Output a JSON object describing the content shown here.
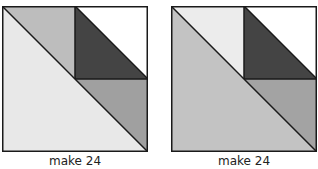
{
  "blocks": [
    {
      "label": "make 24",
      "colors": {
        "large_triangle": "#e8e8e8",
        "top_left_small": "#bdbdbd",
        "top_right_dark": "#444444",
        "top_right_white": "#ffffff",
        "bottom_right_mid": "#a0a0a0",
        "outline": "#1a1a1a"
      }
    },
    {
      "label": "make 24",
      "colors": {
        "large_triangle": "#c3c3c3",
        "top_left_small": "#ececec",
        "top_right_dark": "#444444",
        "top_right_white": "#ffffff",
        "bottom_right_mid": "#a3a3a3",
        "outline": "#1a1a1a"
      }
    }
  ]
}
